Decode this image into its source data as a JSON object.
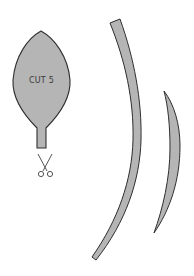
{
  "template": {
    "leaf_piece": {
      "label": "CUT 5"
    },
    "scissors_icon": "scissors-icon",
    "colors": {
      "fill": "#b5b5b5",
      "stroke": "#2e2e2e",
      "background": "#ffffff"
    }
  }
}
